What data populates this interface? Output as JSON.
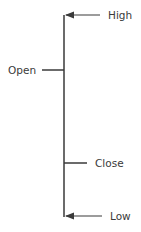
{
  "diagram": {
    "type": "ohlc-bar-anatomy",
    "line_color": "#3a3a3a",
    "labels": {
      "high": "High",
      "open": "Open",
      "close": "Close",
      "low": "Low"
    }
  }
}
